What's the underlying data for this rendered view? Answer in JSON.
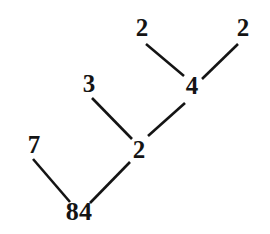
{
  "figure": {
    "type": "factor-tree-diagram",
    "background_color": "#ffffff",
    "line_color": "#141414",
    "text_color": "#141414",
    "line_width": 2.6,
    "width": 270,
    "height": 234
  },
  "nodes": [
    {
      "id": "n_2_topleft",
      "label": "2",
      "x": 142,
      "y": 27,
      "font_size": 25
    },
    {
      "id": "n_2_topright",
      "label": "2",
      "x": 243,
      "y": 27,
      "font_size": 25
    },
    {
      "id": "n_4",
      "label": "4",
      "x": 192,
      "y": 85,
      "font_size": 25
    },
    {
      "id": "n_3",
      "label": "3",
      "x": 89,
      "y": 83,
      "font_size": 25
    },
    {
      "id": "n_2_mid",
      "label": "2",
      "x": 139,
      "y": 149,
      "font_size": 25
    },
    {
      "id": "n_7",
      "label": "7",
      "x": 34,
      "y": 144,
      "font_size": 25
    },
    {
      "id": "n_84",
      "label": "84",
      "x": 79,
      "y": 212,
      "font_size": 26
    }
  ],
  "edges": [
    {
      "id": "e_2topleft_4",
      "from": "n_2_topleft",
      "to": "n_4",
      "x1": 146,
      "y1": 44,
      "x2": 184,
      "y2": 76
    },
    {
      "id": "e_2topright_4",
      "from": "n_2_topright",
      "to": "n_4",
      "x1": 238,
      "y1": 44,
      "x2": 202,
      "y2": 79
    },
    {
      "id": "e_4_2mid",
      "from": "n_4",
      "to": "n_2_mid",
      "x1": 185,
      "y1": 103,
      "x2": 148,
      "y2": 136
    },
    {
      "id": "e_3_2mid",
      "from": "n_3",
      "to": "n_2_mid",
      "x1": 92,
      "y1": 98,
      "x2": 132,
      "y2": 139
    },
    {
      "id": "e_7_84",
      "from": "n_7",
      "to": "n_84",
      "x1": 33,
      "y1": 159,
      "x2": 70,
      "y2": 202
    },
    {
      "id": "e_2mid_84",
      "from": "n_2_mid",
      "to": "n_84",
      "x1": 130,
      "y1": 162,
      "x2": 90,
      "y2": 203
    }
  ],
  "chart_data": {
    "type": "diagram",
    "root": "84",
    "factorization": "84 = 7 × 2 × 3 × 2 × 2",
    "levels": [
      {
        "level": 0,
        "values": [
          "84"
        ]
      },
      {
        "level": 1,
        "values": [
          "7",
          "2"
        ]
      },
      {
        "level": 2,
        "values": [
          "3",
          "4"
        ]
      },
      {
        "level": 3,
        "values": [
          "2",
          "2"
        ]
      }
    ],
    "edges_by_label": [
      [
        "84",
        "7"
      ],
      [
        "84",
        "2"
      ],
      [
        "2",
        "3"
      ],
      [
        "2",
        "4"
      ],
      [
        "4",
        "2"
      ],
      [
        "4",
        "2"
      ]
    ]
  }
}
